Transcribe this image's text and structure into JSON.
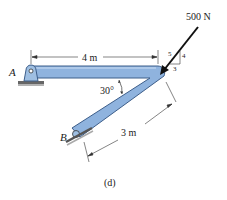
{
  "diagram": {
    "caption": "(d)",
    "labels": {
      "pin_a": "A",
      "roller_b": "B",
      "angle": "30°",
      "top_length": "4 m",
      "diag_length": "3 m",
      "force": "500 N"
    },
    "slope_triangle": {
      "hyp": "5",
      "vertical": "4",
      "horizontal": "3"
    },
    "colors": {
      "member_fill": "#8fb3de",
      "member_edge": "#3d5e8a",
      "line": "#333333",
      "support": "#555555"
    }
  }
}
